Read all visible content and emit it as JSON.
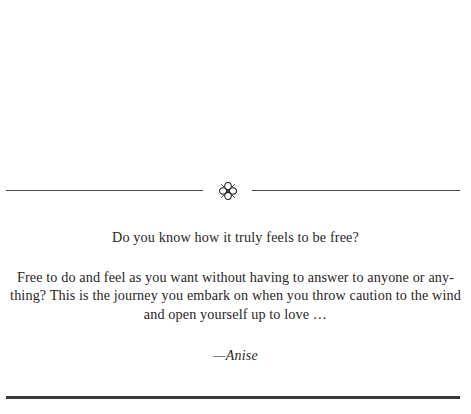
{
  "page": {
    "background_color": "#ffffff",
    "text_color": "#2a2626",
    "rule_color": "#4a4a4a",
    "heavy_rule_color": "#3a3737"
  },
  "divider_top": {
    "ornament_name": "floral-rosette-ornament",
    "ornament_glyph": "❀"
  },
  "epigraph": {
    "lead_line": "Do you know how it truly feels to be free?",
    "body_lines": [
      "Free to do and feel as you want without having to answer to anyone or any-",
      "thing? This is the journey you embark on when you throw caution to the wind",
      "and open yourself up to love …"
    ],
    "attribution": "—Anise"
  }
}
